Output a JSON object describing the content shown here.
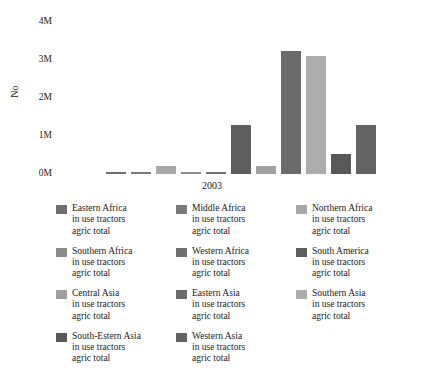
{
  "chart_data": {
    "type": "bar",
    "title": "",
    "subtitle": "",
    "xlabel": "2003",
    "ylabel": "No",
    "ylim": [
      0,
      4000000
    ],
    "ytick_labels": [
      "0M",
      "1M",
      "2M",
      "3M",
      "4M"
    ],
    "ytick_values": [
      0,
      1000000,
      2000000,
      3000000,
      4000000
    ],
    "xtick_labels": [
      "2003"
    ],
    "grid": false,
    "legend_position": "bottom",
    "categories": [
      "2003"
    ],
    "series": [
      {
        "name": "Eastern Africa in use tractors agric total",
        "short": "Eastern Africa",
        "values": [
          60000
        ],
        "color": "#6e6e6e"
      },
      {
        "name": "Middle Africa in use tractors agric total",
        "short": "Middle Africa",
        "values": [
          10000
        ],
        "color": "#7a7a7a"
      },
      {
        "name": "Northern Africa in use tractors agric total",
        "short": "Northern Africa",
        "values": [
          220000
        ],
        "color": "#a8a8a8"
      },
      {
        "name": "Southern Africa in use tractors agric total",
        "short": "Southern Africa",
        "values": [
          50000
        ],
        "color": "#8c8c8c"
      },
      {
        "name": "Western Africa in use tractors agric total",
        "short": "Western Africa",
        "values": [
          20000
        ],
        "color": "#707070"
      },
      {
        "name": "South America in use tractors agric total",
        "short": "South America",
        "values": [
          1280000
        ],
        "color": "#5e5e5e"
      },
      {
        "name": "Central Asia in use tractors agric total",
        "short": "Central Asia",
        "values": [
          220000
        ],
        "color": "#a0a0a0"
      },
      {
        "name": "Eastern Asia in use tractors agric total",
        "short": "Eastern Asia",
        "values": [
          3250000
        ],
        "color": "#6b6b6b"
      },
      {
        "name": "Southern Asia in use tractors agric total",
        "short": "Southern Asia",
        "values": [
          3100000
        ],
        "color": "#adadad"
      },
      {
        "name": "South-Estern Asia in use tractors agric total",
        "short": "South-Estern Asia",
        "values": [
          520000
        ],
        "color": "#585858"
      },
      {
        "name": "Western Asia in use tractors agric total",
        "short": "Western Asia",
        "values": [
          1280000
        ],
        "color": "#636363"
      }
    ]
  },
  "legend": {
    "common_line2": "in use tractors",
    "common_line3": "agric total",
    "items": [
      {
        "label": "Eastern Africa",
        "line2": "in use tractors",
        "line3": "agric total",
        "color": "#6e6e6e"
      },
      {
        "label": "Middle Africa",
        "line2": "in use tractors",
        "line3": "agric total",
        "color": "#7a7a7a"
      },
      {
        "label": "Northern Africa",
        "line2": "in use tractors",
        "line3": "agric total",
        "color": "#a8a8a8"
      },
      {
        "label": "Southern Africa",
        "line2": "in use tractors",
        "line3": "agric total",
        "color": "#8c8c8c"
      },
      {
        "label": "Western Africa",
        "line2": "in use tractors",
        "line3": "agric total",
        "color": "#707070"
      },
      {
        "label": "South America",
        "line2": "in use tractors",
        "line3": "agric total",
        "color": "#5e5e5e"
      },
      {
        "label": "Central Asia",
        "line2": "in use tractors",
        "line3": "agric total",
        "color": "#a0a0a0"
      },
      {
        "label": "Eastern Asia",
        "line2": "in use tractors",
        "line3": "agric total",
        "color": "#6b6b6b"
      },
      {
        "label": "Southern Asia",
        "line2": "in use tractors",
        "line3": "agric total",
        "color": "#adadad"
      },
      {
        "label": "South-Estern Asia",
        "line2": "in use tractors",
        "line3": "agric total",
        "color": "#585858"
      },
      {
        "label": "Western Asia",
        "line2": "in use tractors",
        "line3": "agric total",
        "color": "#636363"
      }
    ]
  }
}
